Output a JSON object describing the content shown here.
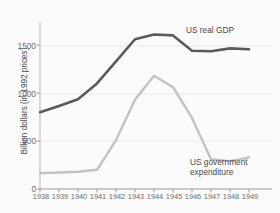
{
  "chart_data": {
    "type": "line",
    "title": "",
    "xlabel": "",
    "ylabel": "Billion dollars (in 1992 prices)",
    "categories": [
      "1938",
      "1939",
      "1940",
      "1941",
      "1942",
      "1943",
      "1944",
      "1945",
      "1946",
      "1947",
      "1948",
      "1949"
    ],
    "xticklabels": [
      "1938",
      "1939",
      "1940",
      "1941",
      "1942",
      "1943",
      "1944",
      "1945",
      "1946",
      "1947",
      "1948",
      "1949"
    ],
    "yticklabels": [
      "0",
      "500",
      "1000",
      "1500"
    ],
    "ytickvalues": [
      0,
      500,
      1000,
      1500
    ],
    "ylim": [
      0,
      1700
    ],
    "grid": "horizontal",
    "legend_position": "inline-annotation",
    "series": [
      {
        "name": "US real GDP",
        "color": "#5b5b5b",
        "values": [
          800,
          865,
          935,
          1100,
          1330,
          1560,
          1610,
          1600,
          1440,
          1435,
          1465,
          1455
        ]
      },
      {
        "name": "US government expenditure",
        "color": "#c2c2c2",
        "values": [
          165,
          172,
          180,
          200,
          510,
          930,
          1180,
          1060,
          740,
          310,
          290,
          330
        ]
      }
    ],
    "annotations": [
      {
        "text": "US real GDP",
        "series": "US real GDP"
      },
      {
        "text": "US government expenditure",
        "series": "US government expenditure"
      }
    ]
  },
  "axes": {
    "ylabel": "Billion dollars (in 1992 prices)"
  },
  "labels": {
    "gdp_line1": "US real GDP",
    "gov_line1": "US government",
    "gov_line2": "expenditure"
  }
}
